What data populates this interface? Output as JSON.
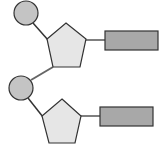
{
  "diagram": {
    "title": "",
    "colors": {
      "stroke": "#333333",
      "phosphate_fill": "#c4c4c4",
      "sugar_fill": "#e6e6e6",
      "base_fill": "#a8a8a8",
      "link": "#555555"
    },
    "nucleotides": [
      {
        "phosphate": {
          "cx": 26,
          "cy": 13,
          "r": 12
        },
        "sugar": {
          "points": "66,23 86,39 80,67 53,67 47,39"
        },
        "base": {
          "x": 105,
          "y": 31,
          "width": 53,
          "height": 19
        }
      },
      {
        "phosphate": {
          "cx": 21,
          "cy": 88,
          "r": 12
        },
        "sugar": {
          "points": "62,99 81,116 75,143 49,143 42,116"
        },
        "base": {
          "x": 100,
          "y": 107,
          "width": 53,
          "height": 19
        }
      }
    ]
  }
}
